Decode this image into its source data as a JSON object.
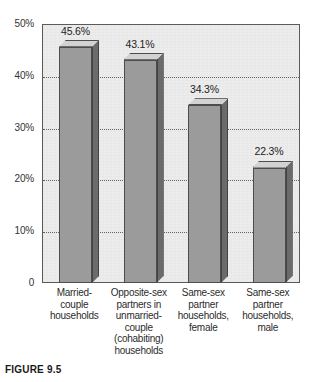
{
  "caption": {
    "label": "FIGURE 9.5"
  },
  "chart_data": {
    "type": "bar",
    "title": "",
    "subtitle": "",
    "xlabel": "",
    "ylabel": "",
    "ylim": [
      0,
      50
    ],
    "grid": true,
    "grid_values": [
      10,
      20,
      30,
      40
    ],
    "legend": "none",
    "value_suffix": "%",
    "categories": [
      "Married-couple households",
      "Opposite-sex partners in unmarried-couple (cohabiting) households",
      "Same-sex partner households, female",
      "Same-sex partner households, male"
    ],
    "category_lines": [
      [
        "Married-",
        "couple",
        "households"
      ],
      [
        "Opposite-sex",
        "partners in",
        "unmarried-",
        "couple",
        "(cohabiting)",
        "households"
      ],
      [
        "Same-sex",
        "partner",
        "households,",
        "female"
      ],
      [
        "Same-sex",
        "partner",
        "households,",
        "male"
      ]
    ],
    "values": [
      45.6,
      43.1,
      34.3,
      22.3
    ],
    "value_labels": [
      "45.6%",
      "43.1%",
      "34.3%",
      "22.3%"
    ],
    "yticks": [
      50,
      40,
      30,
      20,
      10,
      0
    ],
    "ytick_labels": [
      "50%",
      "40%",
      "30%",
      "20%",
      "10%",
      "0"
    ],
    "colors": {
      "bar_front": "#9b9b9b",
      "bar_side": "#6b6b6b",
      "bar_top": "#d2d2d2",
      "plot_background": "#ececec",
      "axis": "#5a5a5a",
      "gridline": "#4a4a4a",
      "text": "#2b2b2b"
    }
  }
}
